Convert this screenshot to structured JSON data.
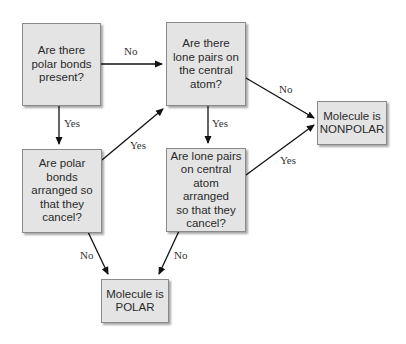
{
  "diagram": {
    "nodes": {
      "polar_bonds": {
        "text": "Are there\npolar bonds\npresent?"
      },
      "lone_pairs": {
        "text": "Are there\nlone pairs on\nthe central\natom?"
      },
      "nonpolar": {
        "text": "Molecule is\nNONPOLAR"
      },
      "bonds_cancel": {
        "text": "Are polar\nbonds\narranged so\nthat they\ncancel?"
      },
      "lone_cancel": {
        "text": "Are lone pairs\non central\natom arranged\nso that they\ncancel?"
      },
      "polar": {
        "text": "Molecule is\nPOLAR"
      }
    },
    "edges": [
      {
        "from": "polar_bonds",
        "to": "lone_pairs",
        "label": "No"
      },
      {
        "from": "polar_bonds",
        "to": "bonds_cancel",
        "label": "Yes"
      },
      {
        "from": "bonds_cancel",
        "to": "lone_pairs",
        "label": "Yes"
      },
      {
        "from": "lone_pairs",
        "to": "nonpolar",
        "label": "No"
      },
      {
        "from": "lone_pairs",
        "to": "lone_cancel",
        "label": "Yes"
      },
      {
        "from": "lone_cancel",
        "to": "nonpolar",
        "label": "Yes"
      },
      {
        "from": "bonds_cancel",
        "to": "polar",
        "label": "No"
      },
      {
        "from": "lone_cancel",
        "to": "polar",
        "label": "No"
      }
    ]
  }
}
